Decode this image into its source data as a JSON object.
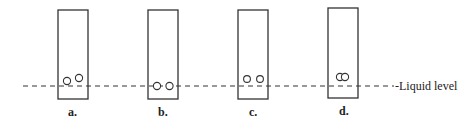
{
  "diagram": {
    "liquid_level_label": "-Liquid level",
    "panels": [
      {
        "id": "a",
        "label": "a.",
        "bubbles": "two bubbles above liquid level, separated, one lower than the other"
      },
      {
        "id": "b",
        "label": "b.",
        "bubbles": "two bubbles sitting on liquid level, side by side"
      },
      {
        "id": "c",
        "label": "c.",
        "bubbles": "two bubbles just above liquid level, side by side, separated"
      },
      {
        "id": "d",
        "label": "d.",
        "bubbles": "two overlapping bubbles above liquid level"
      }
    ],
    "colors": {
      "stroke": "#333333",
      "background": "#ffffff"
    }
  }
}
